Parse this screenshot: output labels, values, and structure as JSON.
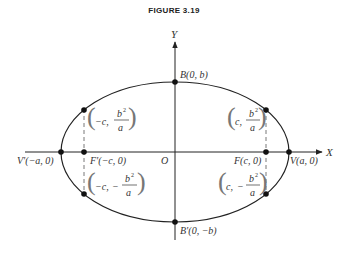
{
  "figure": {
    "title": "FIGURE 3.19"
  },
  "axes": {
    "x_label": "X",
    "y_label": "Y",
    "origin_label": "O"
  },
  "points": {
    "B": "B(0, b)",
    "B_prime": "B′(0, −b)",
    "V": "V(a, 0)",
    "V_prime": "V′(−a, 0)",
    "F": "F(c, 0)",
    "F_prime": "F′(−c, 0)"
  },
  "latus_rectum": {
    "upper_left": {
      "x": "−c,",
      "num": "b",
      "exp": "2",
      "den": "a",
      "sign": ""
    },
    "upper_right": {
      "x": "c,",
      "num": "b",
      "exp": "2",
      "den": "a",
      "sign": ""
    },
    "lower_left": {
      "x": "−c,",
      "num": "b",
      "exp": "2",
      "den": "a",
      "sign": "−"
    },
    "lower_right": {
      "x": "c,",
      "num": "b",
      "exp": "2",
      "den": "a",
      "sign": "−"
    }
  },
  "geometry": {
    "center_px": [
      175,
      152
    ],
    "a_px": 114,
    "b_px": 70,
    "c_px": 92,
    "line_color": "#222222",
    "dash_color": "#555555"
  }
}
